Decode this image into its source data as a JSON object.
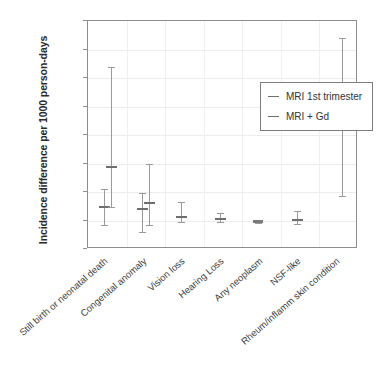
{
  "chart_data": {
    "type": "scatter",
    "title": "",
    "xlabel": "",
    "ylabel": "Incidence difference per 1000 person-days",
    "ylim": [
      -10,
      70
    ],
    "yticks": [
      70,
      60,
      50,
      40,
      30,
      20,
      10,
      0,
      -10
    ],
    "grid": true,
    "legend_position": "upper center",
    "categories": [
      "Still birth or neonatal death",
      "Congenital anomaly",
      "Vision loss",
      "Hearing Loss",
      "Any neoplasm",
      "NSF-like",
      "Rheum/inflamm skin condition"
    ],
    "series": [
      {
        "name": "MRI 1st trimester",
        "color": "#6e6e6e",
        "values": [
          4.6,
          3.9,
          1.2,
          0.4,
          -0.3,
          0.2,
          null
        ],
        "ci_low": [
          -1.6,
          -4.0,
          -0.4,
          -0.7,
          -0.8,
          -1.4,
          null
        ],
        "ci_high": [
          11.0,
          9.5,
          6.5,
          2.8,
          0.2,
          3.5,
          null
        ]
      },
      {
        "name": "MRI + Gd",
        "color": "#6e6e6e",
        "values": [
          18.7,
          6.0,
          null,
          null,
          null,
          null,
          34.0
        ],
        "ci_low": [
          4.6,
          -1.5,
          null,
          null,
          null,
          null,
          8.5
        ],
        "ci_high": [
          54.0,
          20.0,
          null,
          null,
          null,
          null,
          64.0
        ]
      }
    ]
  },
  "legend": {
    "items": [
      {
        "label": "MRI 1st trimester"
      },
      {
        "label": "MRI + Gd"
      }
    ]
  },
  "axes": {
    "y_title": "Incidence difference per 1000 person-days",
    "y_tick_labels": [
      "70",
      "60",
      "50",
      "40",
      "30",
      "20",
      "10",
      "0",
      "−10"
    ],
    "x_tick_labels": [
      "Still birth or neonatal death",
      "Congenital anomaly",
      "Vision loss",
      "Hearing Loss",
      "Any neoplasm",
      "NSF-like",
      "Rheum/inflamm skin condition"
    ]
  },
  "colors": {
    "frame": "#8d8d8d",
    "grid": "#ececec",
    "marker": "#6e6e6e",
    "whisker": "#9a9a9a",
    "text": "#3c3c3c"
  }
}
